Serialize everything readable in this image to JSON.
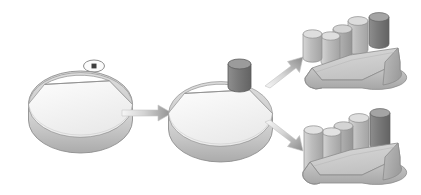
{
  "figure": {
    "background_color": "#ffffff",
    "width": 421,
    "height": 195,
    "caption": ""
  },
  "palette": {
    "face_light": "#f2f2f2",
    "face_white": "#fafafa",
    "face_mid": "#d8d8d8",
    "face_mid2": "#c9c9c9",
    "face_shadow": "#bdbdbd",
    "face_dark": "#9a9a9a",
    "cylinder_dark": "#808080",
    "cylinder_darkest": "#6e6e6e",
    "outline": "#8c8c8c",
    "outline_soft": "#a8a8a8",
    "arrow_start": "#f4f4f4",
    "arrow_end": "#8f8f8f"
  },
  "stages": [
    {
      "id": "stage-1",
      "name": "disk-blank",
      "label": "",
      "description": "Cylindrical disk blank with split top face",
      "shape": "disk",
      "boss_count": 0
    },
    {
      "id": "stage-2",
      "name": "disk-with-boss",
      "label": "",
      "description": "Disk blank with single cylindrical boss added on top face",
      "shape": "disk",
      "boss_count": 1
    },
    {
      "id": "stage-3a",
      "name": "finished-part-upper",
      "label": "",
      "description": "Wedge shaped scoop body with four cylindrical bosses, short variant",
      "shape": "wedge",
      "boss_count": 4
    },
    {
      "id": "stage-3b",
      "name": "finished-part-lower",
      "label": "",
      "description": "Wedge shaped scoop body with four cylindrical bosses, tall variant",
      "shape": "wedge",
      "boss_count": 4
    }
  ],
  "arrows": [
    {
      "id": "arrow-1",
      "name": "arrow-stage1-to-stage2",
      "direction": "right",
      "label": ""
    },
    {
      "id": "arrow-2",
      "name": "arrow-stage2-to-upper",
      "direction": "up-right",
      "label": ""
    },
    {
      "id": "arrow-3",
      "name": "arrow-stage2-to-lower",
      "direction": "down-right",
      "label": ""
    }
  ],
  "annotations": [
    {
      "id": "marker-1",
      "name": "datum-point-marker",
      "glyph": "dot-in-ellipse",
      "label": "",
      "description": "Small ellipse containing a square dot, placed above the first disk"
    }
  ]
}
